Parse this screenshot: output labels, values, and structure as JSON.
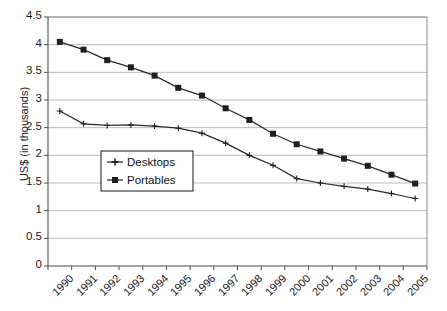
{
  "chart_data": {
    "type": "line",
    "title": "",
    "xlabel": "",
    "ylabel": "US$ (in thousands)",
    "categories": [
      "1990",
      "1991",
      "1992",
      "1993",
      "1994",
      "1995",
      "1996",
      "1997",
      "1998",
      "1999",
      "2000",
      "2001",
      "2002",
      "2003",
      "2004",
      "2005"
    ],
    "ylim": [
      0,
      4.5
    ],
    "ytick_values": [
      0,
      0.5,
      1,
      1.5,
      2,
      2.5,
      3,
      3.5,
      4,
      4.5
    ],
    "ytick_labels": [
      "0",
      "0.5",
      "1",
      "1.5",
      "2",
      "2.5",
      "3",
      "3.5",
      "4",
      "4.5"
    ],
    "grid": true,
    "legend_position": "inside-left-middle",
    "series": [
      {
        "name": "Desktops",
        "marker": "plus",
        "color": "#1f1f1f",
        "values": [
          2.8,
          2.57,
          2.54,
          2.55,
          2.53,
          2.49,
          2.4,
          2.22,
          2.0,
          1.82,
          1.58,
          1.5,
          1.44,
          1.39,
          1.31,
          1.22
        ]
      },
      {
        "name": "Portables",
        "marker": "square",
        "color": "#1f1f1f",
        "values": [
          4.05,
          3.91,
          3.72,
          3.59,
          3.44,
          3.22,
          3.08,
          2.85,
          2.64,
          2.39,
          2.2,
          2.07,
          1.94,
          1.81,
          1.65,
          1.49
        ]
      }
    ]
  },
  "legend": {
    "items": [
      {
        "label": "Desktops",
        "marker": "plus-marker-icon"
      },
      {
        "label": "Portables",
        "marker": "square-marker-icon"
      }
    ]
  }
}
